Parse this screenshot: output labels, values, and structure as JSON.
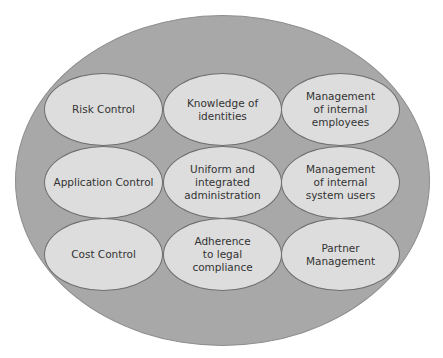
{
  "diagram": {
    "type": "nested-ellipses-grid",
    "colors": {
      "outer_fill": "#a8a8a8",
      "inner_fill": "#dddddd",
      "stroke": "#6e6e6e",
      "text": "#333333"
    },
    "cells": [
      {
        "row": 0,
        "col": 0,
        "label": "Risk Control"
      },
      {
        "row": 0,
        "col": 1,
        "label": "Knowledge of\nidentities"
      },
      {
        "row": 0,
        "col": 2,
        "label": "Management\nof internal\nemployees"
      },
      {
        "row": 1,
        "col": 0,
        "label": "Application Control"
      },
      {
        "row": 1,
        "col": 1,
        "label": "Uniform and\nintegrated\nadministration"
      },
      {
        "row": 1,
        "col": 2,
        "label": "Management\nof internal\nsystem users"
      },
      {
        "row": 2,
        "col": 0,
        "label": "Cost Control"
      },
      {
        "row": 2,
        "col": 1,
        "label": "Adherence\nto legal\ncompliance"
      },
      {
        "row": 2,
        "col": 2,
        "label": "Partner\nManagement"
      }
    ]
  }
}
